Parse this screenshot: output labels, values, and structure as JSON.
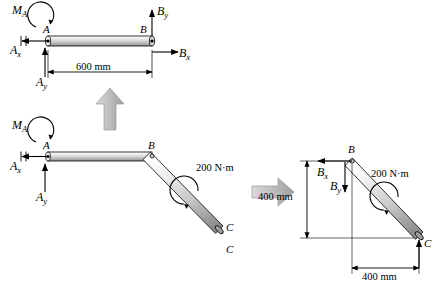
{
  "diagram": {
    "title": "",
    "figures": [
      {
        "name": "top-free-body-diagram",
        "labels": {
          "moment_A": "M",
          "moment_A_sub": "A",
          "force_Ax": "A",
          "force_Ax_sub": "x",
          "force_Ay": "A",
          "force_Ay_sub": "y",
          "force_Bx": "B",
          "force_Bx_sub": "x",
          "force_By": "B",
          "force_By_sub": "y",
          "point_A": "A",
          "point_B": "B",
          "dimension": "600 mm"
        }
      },
      {
        "name": "original-bent-bar-diagram",
        "labels": {
          "moment_A": "M",
          "moment_A_sub": "A",
          "force_Ax": "A",
          "force_Ax_sub": "x",
          "force_Ay": "A",
          "force_Ay_sub": "y",
          "point_A": "A",
          "point_B": "B",
          "point_C_upper": "C",
          "point_C_lower": "C",
          "applied_moment": "200 N·m"
        }
      },
      {
        "name": "lower-segment-free-body-diagram",
        "labels": {
          "force_Bx": "B",
          "force_Bx_sub": "x",
          "force_By": "B",
          "force_By_sub": "y",
          "point_B": "B",
          "point_C": "C",
          "applied_moment": "200 N·m",
          "dimension_vertical": "400 mm",
          "dimension_horizontal": "400 mm"
        }
      }
    ],
    "colors": {
      "bar_light": "#e8e8e8",
      "bar_mid": "#b9b9b9",
      "bar_dark": "#8a8a8a",
      "line": "#000000",
      "arrow_gray": "#b0b0b0"
    }
  }
}
